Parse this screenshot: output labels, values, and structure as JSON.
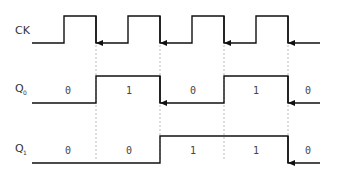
{
  "diagram": {
    "type": "timing",
    "signals": [
      {
        "name": "CK",
        "label": "CK",
        "sub": "",
        "values": [
          "0",
          "1",
          "0",
          "1",
          "0",
          "1",
          "0",
          "1",
          "0",
          "1"
        ]
      },
      {
        "name": "Q0",
        "label": "Q",
        "sub": "0",
        "values": [
          "0",
          "1",
          "0",
          "1",
          "0"
        ]
      },
      {
        "name": "Q1",
        "label": "Q",
        "sub": "1",
        "values": [
          "0",
          "0",
          "1",
          "1",
          "0"
        ]
      }
    ],
    "q0_labels": [
      "0",
      "1",
      "0",
      "1",
      "0"
    ],
    "q1_labels": [
      "0",
      "0",
      "1",
      "1",
      "0"
    ],
    "colors": {
      "line": "#111111",
      "guide": "#aaaaaa",
      "text": "#333333"
    }
  }
}
